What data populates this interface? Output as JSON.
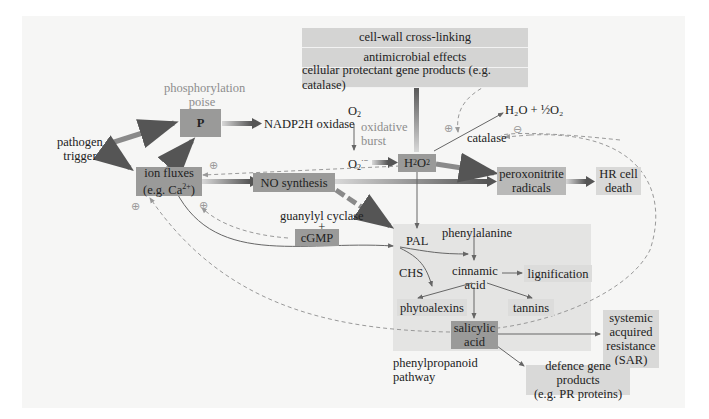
{
  "diagram": {
    "title_labels": {
      "phosphorylation_poise": "phosphorylation\npoise",
      "phosphorylation_line1": "phosphorylation",
      "phosphorylation_line2": "poise",
      "oxidative_burst_line1": "oxidative",
      "oxidative_burst_line2": "burst",
      "phenylpropanoid_line1": "phenylpropanoid",
      "phenylpropanoid_line2": "pathway"
    },
    "nodes": {
      "pathogen_trigger_line1": "pathogen",
      "pathogen_trigger_line2": "trigger",
      "p_box": "P",
      "nadph_oxidase": "NADP2H oxidase",
      "ion_fluxes_line1": "ion fluxes",
      "ion_fluxes_line2_prefix": "(e.g. Ca",
      "ion_fluxes_sup": "2+",
      "ion_fluxes_line2_suffix": ")",
      "no_synthesis": "NO synthesis",
      "guanylyl_cyclase": "guanylyl cyclase",
      "plus_sign": "+",
      "cgmp": "cGMP",
      "o2_top": "O",
      "o2_sub": "2",
      "superoxide": "O",
      "superoxide_sub": "2",
      "superoxide_sup": "·−",
      "h2o2_h": "H",
      "h2o2_sub1": "2",
      "h2o2_o": "O",
      "h2o2_sub2": "2",
      "water_product": "H₂O + ½O₂",
      "catalase": "catalase",
      "peroxonitrite_line1": "peroxonitrite",
      "peroxonitrite_line2": "radicals",
      "hr_cell_death_line1": "HR cell",
      "hr_cell_death_line2": "death",
      "pal": "PAL",
      "phenylalanine": "phenylalanine",
      "chs": "CHS",
      "cinnamic_acid_line1": "cinnamic",
      "cinnamic_acid_line2": "acid",
      "lignification": "lignification",
      "phytoalexins": "phytoalexins",
      "tannins": "tannins",
      "salicylic_acid_line1": "salicylic",
      "salicylic_acid_line2": "acid",
      "sar_line1": "systemic",
      "sar_line2": "acquired",
      "sar_line3": "resistance",
      "sar_line4": "(SAR)",
      "defence_line1": "defence gene products",
      "defence_line2": "(e.g. PR proteins)"
    },
    "effects_stack": [
      "cell-wall cross-linking",
      "antimicrobial effects",
      "cellular protectant gene products (e.g. catalase)"
    ],
    "regulation_signs": {
      "positive": "⊕",
      "negative": "⊖"
    },
    "colors": {
      "panel_bg": "#f6f6f5",
      "dark_box": "#9a9a99",
      "mid_box": "#b9b9b8",
      "light_box": "#d9d9d8",
      "pathway_bg": "#e4e4e3",
      "grey_label": "#8d8d8d",
      "arrow": "#6e6e6e"
    }
  }
}
